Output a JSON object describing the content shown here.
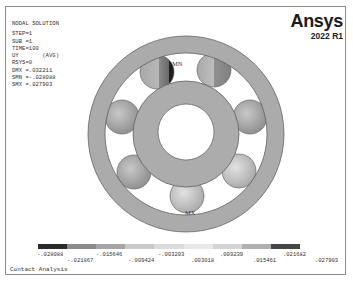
{
  "info": {
    "title": "NODAL SOLUTION",
    "lines": [
      "STEP=1",
      "SUB =1",
      "TIME=100",
      "UY       (AVG)",
      "RSYS=0",
      "DMX =.032211",
      "SMN =-.028088",
      "SMX =.027903"
    ]
  },
  "logo": {
    "brand": "Ansys",
    "version": "2022 R1"
  },
  "markers": {
    "min": "MN",
    "max": "MX"
  },
  "legend": {
    "colors": [
      "#2a2a2a",
      "#8c8c8c",
      "#a6a6a6",
      "#c9c9c9",
      "#dcdcdc",
      "#e8e8e8",
      "#d4d4d4",
      "#b0b0b0",
      "#454545"
    ],
    "ticks_upper": [
      "-.028088",
      "-.015646",
      "-.003203",
      ".009239",
      ".021682"
    ],
    "ticks_lower": [
      "-.021867",
      "-.009424",
      ".003018",
      ".015461",
      ".027903"
    ]
  },
  "footer": {
    "title": "Contact Analysis"
  }
}
